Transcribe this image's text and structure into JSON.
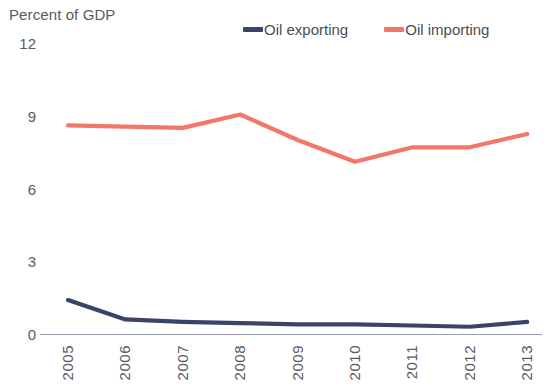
{
  "axis_title": "Percent of GDP",
  "colors": {
    "oil_exporting": "#3b4368",
    "oil_importing": "#f4766b",
    "axis_line": "#9a9cb0",
    "text": "#5a5b5d"
  },
  "legend": {
    "entries": [
      {
        "label": "Oil exporting",
        "color": "#3b4368"
      },
      {
        "label": "Oil importing",
        "color": "#f4766b"
      }
    ]
  },
  "y_axis": {
    "ticks": [
      "12",
      "9",
      "6",
      "3",
      "0"
    ]
  },
  "x_axis": {
    "ticks": [
      "2005",
      "2006",
      "2007",
      "2008",
      "2009",
      "2010",
      "2011",
      "2012",
      "2013"
    ]
  },
  "chart_data": {
    "type": "line",
    "title": "Percent of GDP",
    "xlabel": "",
    "ylabel": "Percent of GDP",
    "ylim": [
      0,
      12
    ],
    "yticks": [
      0,
      3,
      6,
      9,
      12
    ],
    "grid": false,
    "legend_position": "top-right",
    "x": [
      "2005",
      "2006",
      "2007",
      "2008",
      "2009",
      "2010",
      "2011",
      "2012",
      "2013"
    ],
    "series": [
      {
        "name": "Oil exporting",
        "color": "#3b4368",
        "values": [
          1.4,
          0.6,
          0.5,
          0.45,
          0.4,
          0.4,
          0.35,
          0.3,
          0.5
        ]
      },
      {
        "name": "Oil importing",
        "color": "#f4766b",
        "values": [
          8.6,
          8.55,
          8.5,
          9.05,
          8.0,
          7.1,
          7.7,
          7.7,
          8.25
        ]
      }
    ]
  }
}
